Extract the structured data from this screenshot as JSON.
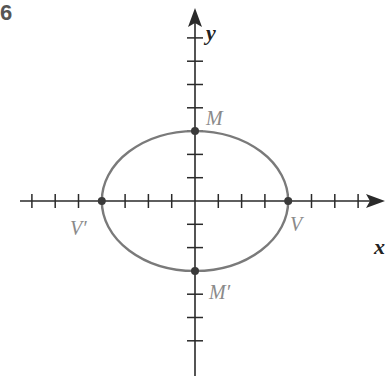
{
  "figure": {
    "number_fragment": "6",
    "type": "ellipse-on-coordinate-axes"
  },
  "axes": {
    "x_label": "x",
    "y_label": "y",
    "x_ticks": [
      -7,
      -6,
      -5,
      -4,
      -3,
      -2,
      -1,
      1,
      2,
      3,
      4,
      5,
      6,
      7
    ],
    "y_ticks": [
      -6,
      -5,
      -4,
      -3,
      -2,
      -1,
      1,
      2,
      3,
      4,
      5,
      6,
      7
    ]
  },
  "ellipse": {
    "center": [
      0,
      0
    ],
    "semi_major_x": 4,
    "semi_minor_y": 3,
    "stroke_color": "#7a7a7a"
  },
  "points": [
    {
      "name": "V",
      "label": "V",
      "coords": [
        4,
        0
      ]
    },
    {
      "name": "V-prime",
      "label": "V′",
      "coords": [
        -4,
        0
      ]
    },
    {
      "name": "M",
      "label": "M",
      "coords": [
        0,
        3
      ]
    },
    {
      "name": "M-prime",
      "label": "M′",
      "coords": [
        0,
        -3
      ]
    }
  ],
  "colors": {
    "axis": "#2a2a2a",
    "curve": "#7a7a7a",
    "label": "#8a8a8a"
  }
}
